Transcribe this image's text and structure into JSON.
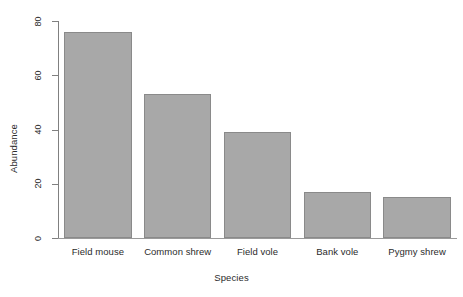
{
  "chart_data": {
    "type": "bar",
    "title": "",
    "subtitle": "",
    "xlabel": "Species",
    "ylabel": "Abundance",
    "categories": [
      "Field mouse",
      "Common shrew",
      "Field vole",
      "Bank vole",
      "Pygmy shrew"
    ],
    "values": [
      76,
      53,
      39,
      17,
      15
    ],
    "ylim": [
      0,
      80
    ],
    "yticks": [
      0,
      20,
      40,
      60,
      80
    ],
    "ytick_labels": [
      "0",
      "20",
      "40",
      "60",
      "80"
    ],
    "grid": false,
    "legend": null,
    "orientation": "vertical",
    "bar_fill_color": "#a8a8a8",
    "bar_border_color": "#8a8a8a",
    "axis_color": "#808080",
    "background_color": "#ffffff",
    "text_color": "#2b2b2b"
  },
  "axes": {
    "y_title": "Abundance",
    "x_title": "Species"
  }
}
